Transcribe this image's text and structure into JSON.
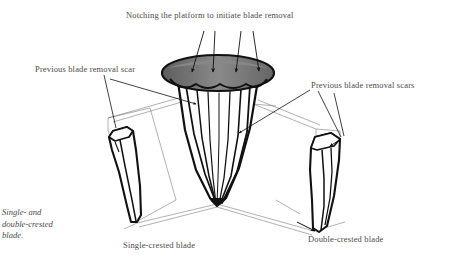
{
  "figure": {
    "background_color": "#ffffff",
    "ink_color": "#111111",
    "text_color": "#4a4a4a",
    "platform_fill_dark": "#5a5a5a",
    "platform_fill_light": "#8e8e8e",
    "title": "Notching the platform to initiate blade removal",
    "labels": {
      "left_scar": "Previous blade removal scar",
      "right_scars": "Previous blade removal scars",
      "single_blade": "Single-crested blade",
      "double_blade": "Double-crested blade"
    },
    "caption": {
      "line1": "Single- and",
      "line2": "double-crested",
      "line3": "blade."
    },
    "icons": {
      "core": "conical-core-icon",
      "platform": "striking-platform-icon",
      "left_blade": "single-crested-blade-icon",
      "right_blade": "double-crested-blade-icon",
      "notch_arrows": "notch-arrow-icon",
      "leader_lines": "leader-line-icon",
      "projection_lines": "projection-line-icon"
    },
    "counts": {
      "notch_arrows": 4,
      "left_leader_lines": 2,
      "right_leader_lines": 2,
      "blades_depicted": 2
    }
  }
}
